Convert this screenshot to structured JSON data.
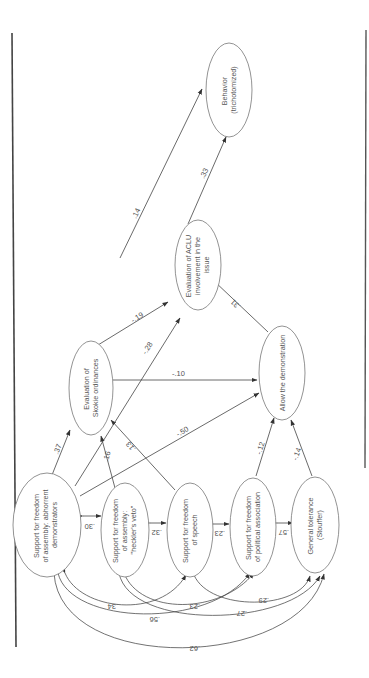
{
  "figure": {
    "orientation": "rotated-90-ccw",
    "nodes": {
      "abhorrent": {
        "lines": [
          "Support for freedom",
          "of assembly: abhorrent",
          "demonstrators"
        ]
      },
      "heckler": {
        "lines": [
          "Support for freedom",
          "of assembly:",
          "\"heckler's veto\""
        ]
      },
      "speech": {
        "lines": [
          "Support for freedom",
          "of speech"
        ]
      },
      "association": {
        "lines": [
          "Support for freedom",
          "of political association"
        ]
      },
      "tolerance": {
        "lines": [
          "General tolerance",
          "(Stouffer)"
        ]
      },
      "skokie": {
        "lines": [
          "Evaluation of",
          "Skokie ordinances"
        ]
      },
      "allow": {
        "lines": [
          "Allow the demonstration"
        ]
      },
      "aclu": {
        "lines": [
          "Evaluation of ACLU",
          "involvement in the",
          "issue"
        ]
      },
      "behavior": {
        "lines": [
          "Behavior",
          "(trichotomized)"
        ]
      }
    },
    "paths": [
      {
        "from": "abhorrent",
        "to": "skokie",
        "coef": ".37"
      },
      {
        "from": "heckler",
        "to": "skokie",
        "coef": ".16"
      },
      {
        "from": "speech",
        "to": "skokie",
        "coef": ".13"
      },
      {
        "from": "abhorrent",
        "to": "aclu",
        "coef": "-.28"
      },
      {
        "from": "abhorrent",
        "to": "allow",
        "coef": "-.50"
      },
      {
        "from": "skokie",
        "to": "aclu",
        "coef": "-.19"
      },
      {
        "from": "skokie",
        "to": "allow",
        "coef": "-.10"
      },
      {
        "from": "skokie",
        "to": "behavior",
        "coef": ".14"
      },
      {
        "from": "association",
        "to": "allow",
        "coef": "-.12"
      },
      {
        "from": "tolerance",
        "to": "allow",
        "coef": "-.14"
      },
      {
        "from": "allow",
        "to": "aclu",
        "coef": ".31"
      },
      {
        "from": "aclu",
        "to": "behavior",
        "coef": ".33"
      }
    ],
    "correlations": [
      {
        "a": "abhorrent",
        "b": "heckler",
        "coef": ".30"
      },
      {
        "a": "heckler",
        "b": "speech",
        "coef": ".32"
      },
      {
        "a": "speech",
        "b": "association",
        "coef": ".23"
      },
      {
        "a": "association",
        "b": "tolerance",
        "coef": ".57"
      },
      {
        "a": "abhorrent",
        "b": "speech",
        "coef": ".34"
      },
      {
        "a": "abhorrent",
        "b": "association",
        "coef": ".56"
      },
      {
        "a": "heckler",
        "b": "association",
        "coef": ".23"
      },
      {
        "a": "speech",
        "b": "tolerance",
        "coef": ".29"
      },
      {
        "a": "heckler",
        "b": "tolerance",
        "coef": ".27"
      },
      {
        "a": "abhorrent",
        "b": "tolerance",
        "coef": ".62"
      }
    ]
  }
}
